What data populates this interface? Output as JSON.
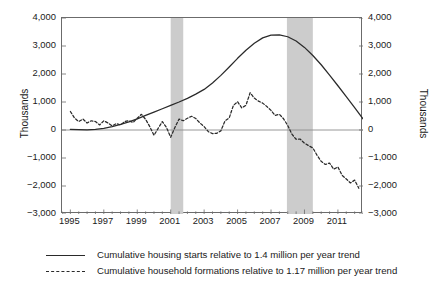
{
  "chart_data": {
    "type": "line",
    "title": "",
    "xlabel": "",
    "ylabel": "Thousands",
    "ylabel_right": "Thousands",
    "xlim": [
      1994.5,
      2012.5
    ],
    "ylim": [
      -3000,
      4000
    ],
    "grid": false,
    "legend_position": "bottom",
    "y_ticks": [
      4000,
      3000,
      2000,
      1000,
      0,
      -1000,
      -2000,
      -3000
    ],
    "y_tick_labels": [
      "4,000",
      "3,000",
      "2,000",
      "1,000",
      "0",
      "-1,000",
      "-2,000",
      "-3,000"
    ],
    "x_ticks": [
      1995,
      1997,
      1999,
      2001,
      2003,
      2005,
      2007,
      2009,
      2011
    ],
    "x_tick_labels": [
      "1995",
      "1997",
      "1999",
      "2001",
      "2003",
      "2005",
      "2007",
      "2009",
      "2011"
    ],
    "x_minor_tick_step": 0.5,
    "zero_line": 0,
    "shaded_regions": [
      {
        "label": "recession",
        "x0": 2001.0,
        "x1": 2001.75,
        "color": "#cccccc"
      },
      {
        "label": "recession",
        "x0": 2007.95,
        "x1": 2009.5,
        "color": "#cccccc"
      }
    ],
    "series": [
      {
        "name": "Cumulative housing starts relative to 1.4 million per year trend",
        "style": "solid",
        "color": "#2a2a2a",
        "x": [
          1995.0,
          1995.5,
          1996.0,
          1996.5,
          1997.0,
          1997.5,
          1998.0,
          1998.5,
          1999.0,
          1999.5,
          2000.0,
          2000.5,
          2001.0,
          2001.5,
          2002.0,
          2002.5,
          2003.0,
          2003.5,
          2004.0,
          2004.5,
          2005.0,
          2005.5,
          2006.0,
          2006.5,
          2007.0,
          2007.5,
          2008.0,
          2008.5,
          2009.0,
          2009.5,
          2010.0,
          2010.5,
          2011.0,
          2011.5,
          2012.0,
          2012.5
        ],
        "y": [
          20,
          10,
          5,
          20,
          60,
          120,
          200,
          290,
          400,
          520,
          640,
          760,
          880,
          1000,
          1130,
          1280,
          1450,
          1680,
          1950,
          2250,
          2560,
          2850,
          3100,
          3290,
          3390,
          3400,
          3330,
          3180,
          2950,
          2660,
          2330,
          1960,
          1580,
          1190,
          800,
          400
        ]
      },
      {
        "name": "Cumulative household formations relative to 1.17 million per year trend",
        "style": "dashed",
        "color": "#2a2a2a",
        "x": [
          1995.0,
          1995.25,
          1995.5,
          1995.75,
          1996.0,
          1996.25,
          1996.5,
          1996.75,
          1997.0,
          1997.25,
          1997.5,
          1997.75,
          1998.0,
          1998.25,
          1998.5,
          1998.75,
          1999.0,
          1999.25,
          1999.5,
          1999.75,
          2000.0,
          2000.25,
          2000.5,
          2000.75,
          2001.0,
          2001.25,
          2001.5,
          2001.75,
          2002.0,
          2002.25,
          2002.5,
          2002.75,
          2003.0,
          2003.25,
          2003.5,
          2003.75,
          2004.0,
          2004.25,
          2004.5,
          2004.75,
          2005.0,
          2005.25,
          2005.5,
          2005.75,
          2006.0,
          2006.25,
          2006.5,
          2006.75,
          2007.0,
          2007.25,
          2007.5,
          2007.75,
          2008.0,
          2008.25,
          2008.5,
          2008.75,
          2009.0,
          2009.25,
          2009.5,
          2009.75,
          2010.0,
          2010.25,
          2010.5,
          2010.75,
          2011.0,
          2011.25,
          2011.5,
          2011.75,
          2012.0,
          2012.25
        ],
        "y": [
          660,
          430,
          300,
          390,
          250,
          330,
          300,
          180,
          330,
          250,
          150,
          230,
          180,
          300,
          330,
          270,
          420,
          560,
          380,
          120,
          -190,
          60,
          300,
          90,
          -260,
          90,
          390,
          330,
          420,
          490,
          410,
          250,
          120,
          -60,
          -130,
          -120,
          -30,
          330,
          430,
          880,
          1010,
          790,
          880,
          1330,
          1140,
          1030,
          960,
          840,
          700,
          520,
          560,
          400,
          160,
          -150,
          -330,
          -330,
          -470,
          -560,
          -640,
          -900,
          -1120,
          -1230,
          -1180,
          -1400,
          -1320,
          -1620,
          -1750,
          -1890,
          -1790,
          -2080
        ]
      }
    ]
  },
  "axes": {
    "left_title": "Thousands",
    "right_title": "Thousands"
  },
  "legend": {
    "entries": [
      {
        "key": "solid",
        "label": "Cumulative housing starts relative to 1.4 million per year trend"
      },
      {
        "key": "dashed",
        "label": "Cumulative household formations relative to 1.17 million per year trend"
      }
    ]
  }
}
